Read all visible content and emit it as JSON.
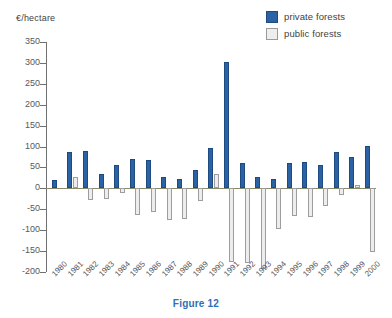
{
  "chart_data": {
    "type": "bar",
    "title": "Figure 12",
    "xlabel": "",
    "ylabel": "€/hectare",
    "ylim": [
      -200,
      350
    ],
    "ytick_step": 50,
    "yticks": [
      350,
      300,
      250,
      200,
      150,
      100,
      50,
      0,
      -50,
      -100,
      -150,
      -200
    ],
    "ytick_labels": [
      "350",
      "300",
      "250",
      "200",
      "150",
      "100",
      "50",
      "0",
      "-50",
      "-100",
      "-150",
      "-200"
    ],
    "grid": false,
    "legend_position": "top-right",
    "categories": [
      "1980",
      "1981",
      "1982",
      "1983",
      "1984",
      "1985",
      "1986",
      "1987",
      "1988",
      "1989",
      "1990",
      "1991",
      "1992",
      "1993",
      "1994",
      "1995",
      "1996",
      "1997",
      "1998",
      "1999",
      "2000"
    ],
    "series": [
      {
        "name": "private forests",
        "color": "#2a62a4",
        "values": [
          19,
          88,
          90,
          35,
          55,
          70,
          67,
          26,
          23,
          45,
          96,
          303,
          60,
          28,
          22,
          60,
          64,
          55,
          87,
          74,
          102
        ]
      },
      {
        "name": "public forests",
        "color": "#ededed",
        "values": [
          0,
          28,
          -28,
          -26,
          -12,
          -63,
          -57,
          -76,
          -74,
          -30,
          34,
          -176,
          -179,
          -193,
          -96,
          -65,
          -69,
          -42,
          -15,
          8,
          -151
        ]
      }
    ]
  },
  "legend": {
    "items": [
      {
        "label": "private forests",
        "swatch": "private"
      },
      {
        "label": "public forests",
        "swatch": "public"
      }
    ]
  },
  "axis": {
    "y_title": "€/hectare"
  },
  "caption": {
    "text": "Figure 12",
    "color": "#2f6fb5"
  },
  "colors": {
    "private_fill": "#2a62a4",
    "private_stroke": "#1d4a80",
    "public_fill": "#ededed",
    "public_stroke": "#9d9d9d",
    "axis": "#6f6f71",
    "text": "#58585a",
    "caption": "#2f6fb5"
  }
}
